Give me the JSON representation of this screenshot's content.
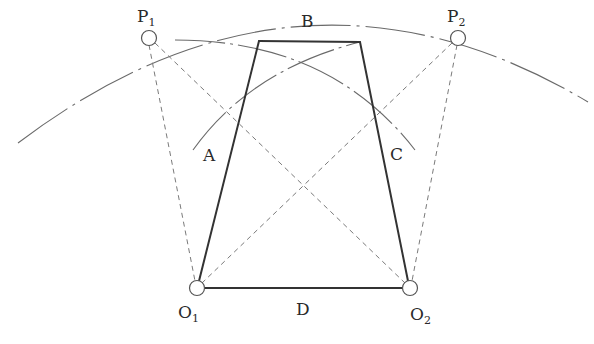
{
  "diagram": {
    "type": "four-bar linkage construction",
    "colors": {
      "link": "#333333",
      "construction": "#777777",
      "arc": "#666666",
      "pivot_fill": "#ffffff",
      "pivot_stroke": "#555555"
    },
    "points": {
      "P1": {
        "x": 149,
        "y": 38
      },
      "P2": {
        "x": 458,
        "y": 38
      },
      "O1": {
        "x": 197,
        "y": 288
      },
      "O2": {
        "x": 410,
        "y": 288
      },
      "B_left": {
        "x": 259,
        "y": 41
      },
      "B_right": {
        "x": 360,
        "y": 42
      }
    },
    "links": [
      {
        "name": "A",
        "from": "O1",
        "to": "B_left"
      },
      {
        "name": "B",
        "from": "B_left",
        "to": "B_right"
      },
      {
        "name": "C",
        "from": "B_right",
        "to": "O2"
      },
      {
        "name": "D",
        "from": "O1",
        "to": "O2"
      }
    ],
    "dashed_lines": [
      {
        "from": "P1",
        "to": "O1"
      },
      {
        "from": "P1",
        "to": "O2"
      },
      {
        "from": "P2",
        "to": "O1"
      },
      {
        "from": "P2",
        "to": "O2"
      }
    ],
    "labels": {
      "P1": {
        "main": "P",
        "sub": "1"
      },
      "P2": {
        "main": "P",
        "sub": "2"
      },
      "O1": {
        "main": "O",
        "sub": "1"
      },
      "O2": {
        "main": "O",
        "sub": "2"
      },
      "A": "A",
      "B": "B",
      "C": "C",
      "D": "D"
    }
  }
}
